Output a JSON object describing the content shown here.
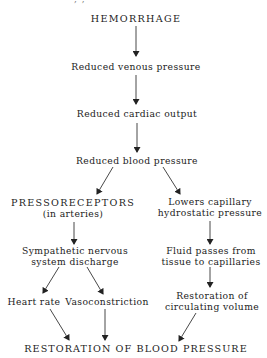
{
  "diagram": {
    "type": "flowchart",
    "nodes": {
      "hemorrhage": "HEMORRHAGE",
      "reduced_venous_pressure": "Reduced venous pressure",
      "reduced_cardiac_output": "Reduced cardiac output",
      "reduced_blood_pressure": "Reduced blood pressure",
      "pressoreceptors": {
        "line1": "PRESSORECEPTORS",
        "line2": "(in arteries)"
      },
      "lowers_capillary": {
        "line1": "Lowers capillary",
        "line2": "hydrostatic pressure"
      },
      "sympathetic": {
        "line1": "Sympathetic nervous",
        "line2": "system discharge"
      },
      "fluid_passes": {
        "line1": "Fluid passes from",
        "line2": "tissue to capillaries"
      },
      "heart_rate": "Heart rate",
      "vasoconstriction": "Vasoconstriction",
      "restoration_volume": {
        "line1": "Restoration of",
        "line2": "circulating volume"
      },
      "restoration_bp": "RESTORATION OF BLOOD PRESSURE"
    },
    "edges": [
      [
        "hemorrhage",
        "reduced_venous_pressure"
      ],
      [
        "reduced_venous_pressure",
        "reduced_cardiac_output"
      ],
      [
        "reduced_cardiac_output",
        "reduced_blood_pressure"
      ],
      [
        "reduced_blood_pressure",
        "pressoreceptors"
      ],
      [
        "reduced_blood_pressure",
        "lowers_capillary"
      ],
      [
        "pressoreceptors",
        "sympathetic"
      ],
      [
        "lowers_capillary",
        "fluid_passes"
      ],
      [
        "sympathetic",
        "heart_rate"
      ],
      [
        "sympathetic",
        "vasoconstriction"
      ],
      [
        "fluid_passes",
        "restoration_volume"
      ],
      [
        "heart_rate",
        "restoration_bp"
      ],
      [
        "vasoconstriction",
        "restoration_bp"
      ],
      [
        "restoration_volume",
        "restoration_bp"
      ]
    ],
    "colors": {
      "ink": "#222222",
      "background": "#ffffff"
    }
  }
}
